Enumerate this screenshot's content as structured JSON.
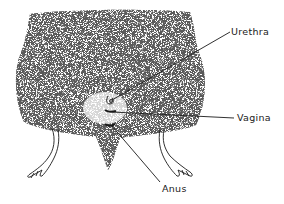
{
  "figure": {
    "colors": {
      "ink": "#1a1a1a",
      "background": "#ffffff",
      "stipple": "#333333"
    },
    "labels": [
      {
        "id": "urethra",
        "text": "Urethra",
        "x": 231,
        "y": 27
      },
      {
        "id": "vagina",
        "text": "Vagina",
        "x": 237,
        "y": 113
      },
      {
        "id": "anus",
        "text": "Anus",
        "x": 162,
        "y": 184
      }
    ]
  }
}
